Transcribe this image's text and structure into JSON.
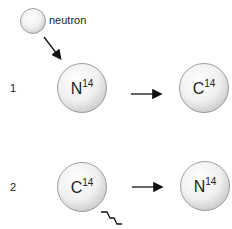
{
  "diagram": {
    "neutron": {
      "label": "neutron"
    },
    "rows": [
      {
        "number": "1",
        "from": {
          "symbol": "N",
          "mass": "14"
        },
        "to": {
          "symbol": "C",
          "mass": "14"
        }
      },
      {
        "number": "2",
        "from": {
          "symbol": "C",
          "mass": "14"
        },
        "to": {
          "symbol": "N",
          "mass": "14"
        }
      }
    ]
  }
}
